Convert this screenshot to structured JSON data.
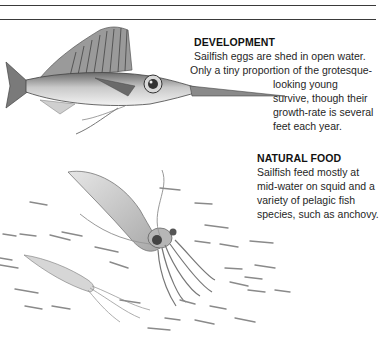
{
  "page": {
    "rules": 2,
    "sections": [
      {
        "heading": "DEVELOPMENT",
        "lines": [
          "Sailfish eggs are shed in open water.",
          "Only a tiny proportion of the grotesque-",
          "looking young",
          "survive, though their",
          "growth-rate is several",
          "feet each year."
        ]
      },
      {
        "heading": "NATURAL FOOD",
        "lines": [
          "Sailfish feed mostly at",
          "mid-water on squid and a",
          "variety of pelagic fish",
          "species, such as anchovy."
        ]
      }
    ],
    "illustrations": [
      {
        "subject": "young-sailfish"
      },
      {
        "subject": "squid-large"
      },
      {
        "subject": "squid-small"
      },
      {
        "subject": "anchovy-school"
      }
    ]
  }
}
